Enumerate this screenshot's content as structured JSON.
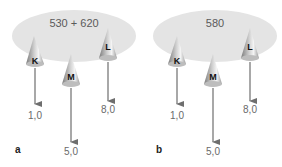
{
  "panels": [
    {
      "letter": "a",
      "ellipse_text": "530 + 620",
      "cones": [
        {
          "label": "K",
          "value": "1,0"
        },
        {
          "label": "M",
          "value": "5,0"
        },
        {
          "label": "L",
          "value": "8,0"
        }
      ]
    },
    {
      "letter": "b",
      "ellipse_text": "580",
      "cones": [
        {
          "label": "K",
          "value": "1,0"
        },
        {
          "label": "M",
          "value": "5,0"
        },
        {
          "label": "L",
          "value": "8,0"
        }
      ]
    }
  ],
  "colors": {
    "ellipse": "#e4e4e4",
    "arrow": "#6e6e6e",
    "cone_dark": "#8a8a8a",
    "cone_light": "#f2f2f2"
  }
}
